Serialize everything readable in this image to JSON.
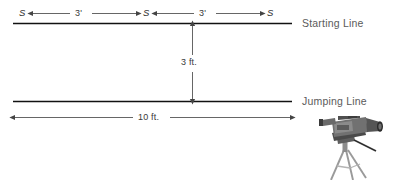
{
  "diagram": {
    "lines": [
      {
        "id": "starting-line",
        "label": "Starting Line",
        "y": 23
      },
      {
        "id": "jumping-line",
        "label": "Jumping Line",
        "y": 101
      }
    ],
    "stations": [
      {
        "id": "s-left",
        "label": "S",
        "x": 23
      },
      {
        "id": "s-mid",
        "label": "S",
        "x": 146
      },
      {
        "id": "s-right",
        "label": "S",
        "x": 270
      }
    ],
    "dimensions": [
      {
        "id": "dim-left",
        "label": "3'",
        "orientation": "horizontal",
        "from": "s-left",
        "to": "s-mid"
      },
      {
        "id": "dim-right",
        "label": "3'",
        "orientation": "horizontal",
        "from": "s-mid",
        "to": "s-right"
      },
      {
        "id": "dim-vert",
        "label": "3 ft.",
        "orientation": "vertical",
        "from": "starting-line",
        "to": "jumping-line"
      },
      {
        "id": "dim-base",
        "label": "10 ft.",
        "orientation": "horizontal",
        "from": "left-end",
        "to": "right-end"
      }
    ],
    "graphics": [
      {
        "id": "camera-tripod",
        "name": "video-camera-on-tripod"
      }
    ],
    "colors": {
      "background": "#ffffff",
      "line": "#1a1a1a",
      "dimension_line": "#555555",
      "label_text": "#5a5a5a",
      "dimension_text": "#3a3a3a",
      "camera_body": "#6e6e6e",
      "camera_dark": "#3c3c3c",
      "tripod": "#8a8a8a"
    }
  }
}
